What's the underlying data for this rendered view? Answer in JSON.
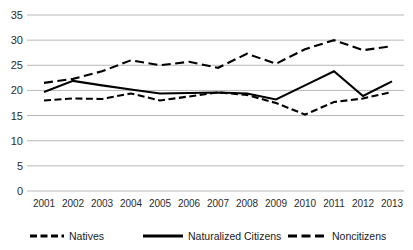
{
  "chart_data": {
    "type": "line",
    "title": "",
    "subtitle": "",
    "xlabel": "",
    "ylabel": "",
    "categories": [
      "2001",
      "2002",
      "2003",
      "2004",
      "2005",
      "2006",
      "2007",
      "2008",
      "2009",
      "2010",
      "2011",
      "2012",
      "2013"
    ],
    "x": [
      2001,
      2002,
      2003,
      2004,
      2005,
      2006,
      2007,
      2008,
      2009,
      2010,
      2011,
      2012,
      2013
    ],
    "ylim": [
      0,
      35
    ],
    "y_ticks": [
      "0",
      "5",
      "10",
      "15",
      "20",
      "25",
      "30",
      "35"
    ],
    "y_tick_values": [
      0,
      5,
      10,
      15,
      20,
      25,
      30,
      35
    ],
    "grid": true,
    "legend_position": "bottom",
    "series": [
      {
        "name": "Natives",
        "style": "short-dash",
        "color": "#000000",
        "values": [
          18.0,
          18.4,
          18.3,
          19.4,
          18.0,
          18.8,
          19.6,
          19.1,
          17.5,
          15.2,
          17.7,
          18.4,
          19.7
        ]
      },
      {
        "name": "Naturalized Citizens",
        "style": "solid",
        "color": "#000000",
        "values": [
          19.7,
          21.9,
          21.0,
          20.2,
          19.4,
          19.5,
          19.6,
          19.4,
          18.2,
          21.0,
          23.8,
          18.9,
          21.8
        ]
      },
      {
        "name": "Noncitizens",
        "style": "medium-dash",
        "color": "#000000",
        "values": [
          21.5,
          22.3,
          23.8,
          26.0,
          25.0,
          25.7,
          24.5,
          27.3,
          25.3,
          28.2,
          30.0,
          28.0,
          28.8
        ]
      }
    ]
  },
  "legend": {
    "items": [
      {
        "label": "Natives",
        "swatch": "short-dash-swatch"
      },
      {
        "label": "Naturalized Citizens",
        "swatch": "solid-line-swatch"
      },
      {
        "label": "Noncitizens",
        "swatch": "medium-dash-swatch"
      }
    ]
  },
  "colors": {
    "ink": "#000000",
    "gridline": "#a6a6a6",
    "background": "#ffffff",
    "tick_text": "#2b2b2b"
  }
}
